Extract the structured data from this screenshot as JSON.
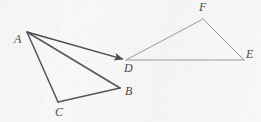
{
  "figure": {
    "background_color": "#f7f7f5",
    "canvas": {
      "width": 261,
      "height": 122
    },
    "stroke_colors": {
      "source_triangle": "#55555b",
      "image_triangle": "#9b9ba0",
      "arrow": "#4a4a50",
      "label": "#4a4a50"
    },
    "stroke_widths": {
      "source_triangle": 1.5,
      "image_triangle": 1.0,
      "arrow": 1.4
    },
    "points": [
      {
        "id": "A",
        "label": "A",
        "x": 27,
        "y": 32,
        "label_x": 14,
        "label_y": 33
      },
      {
        "id": "B",
        "label": "B",
        "x": 120,
        "y": 88,
        "label_x": 125,
        "label_y": 85
      },
      {
        "id": "C",
        "label": "C",
        "x": 58,
        "y": 102,
        "label_x": 55,
        "label_y": 106
      },
      {
        "id": "D",
        "label": "D",
        "x": 126,
        "y": 60,
        "label_x": 124,
        "label_y": 62
      },
      {
        "id": "E",
        "label": "E",
        "x": 244,
        "y": 60,
        "label_x": 246,
        "label_y": 48
      },
      {
        "id": "F",
        "label": "F",
        "x": 203,
        "y": 19,
        "label_x": 199,
        "label_y": 1
      }
    ],
    "segments": [
      {
        "id": "AB",
        "from": "A",
        "to": "B",
        "group": "source_triangle"
      },
      {
        "id": "BC",
        "from": "B",
        "to": "C",
        "group": "source_triangle"
      },
      {
        "id": "CA",
        "from": "C",
        "to": "A",
        "group": "source_triangle"
      },
      {
        "id": "DE",
        "from": "D",
        "to": "E",
        "group": "image_triangle"
      },
      {
        "id": "EF",
        "from": "E",
        "to": "F",
        "group": "image_triangle"
      },
      {
        "id": "FD",
        "from": "F",
        "to": "D",
        "group": "image_triangle"
      }
    ],
    "arrows": [
      {
        "id": "AD",
        "from": "A",
        "to": "D",
        "group": "arrow",
        "head": "end"
      }
    ]
  }
}
